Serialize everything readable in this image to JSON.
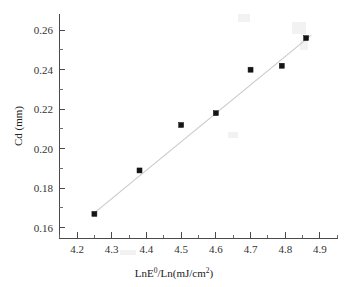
{
  "chart_data": {
    "type": "scatter",
    "title": "",
    "xlabel": "LnE⁰/Ln(mJ/cm²)",
    "xlabel_base": "LnE",
    "xlabel_sup": "0",
    "xlabel_rest": "/Ln(mJ/cm",
    "xlabel_sup2": "2",
    "xlabel_end": ")",
    "ylabel": "Cd (mm)",
    "xlim": [
      4.148,
      4.952
    ],
    "ylim": [
      0.1548,
      0.2682
    ],
    "grid": false,
    "legend": null,
    "x": [
      4.25,
      4.38,
      4.5,
      4.6,
      4.7,
      4.79,
      4.86
    ],
    "y": [
      0.167,
      0.189,
      0.212,
      0.218,
      0.24,
      0.242,
      0.256
    ],
    "points": [
      {
        "x": 4.25,
        "y": 0.167
      },
      {
        "x": 4.38,
        "y": 0.189
      },
      {
        "x": 4.5,
        "y": 0.212
      },
      {
        "x": 4.6,
        "y": 0.218
      },
      {
        "x": 4.7,
        "y": 0.24
      },
      {
        "x": 4.79,
        "y": 0.242
      },
      {
        "x": 4.86,
        "y": 0.256
      }
    ],
    "marker": {
      "shape": "square",
      "color": "#151515",
      "size": 5
    },
    "fit_line": {
      "type": "linear",
      "color": "#c9c9c9",
      "x_start": 4.25,
      "y_start": 0.1675,
      "x_end": 4.875,
      "y_end": 0.2575
    },
    "x_ticks": [
      {
        "value": 4.2,
        "label": "4.2"
      },
      {
        "value": 4.3,
        "label": "4.3"
      },
      {
        "value": 4.4,
        "label": "4.4"
      },
      {
        "value": 4.5,
        "label": "4.5"
      },
      {
        "value": 4.6,
        "label": "4.6"
      },
      {
        "value": 4.7,
        "label": "4.7"
      },
      {
        "value": 4.8,
        "label": "4.8"
      },
      {
        "value": 4.9,
        "label": "4.9"
      }
    ],
    "x_minor_ticks": [
      4.15,
      4.25,
      4.35,
      4.45,
      4.55,
      4.65,
      4.75,
      4.85,
      4.95
    ],
    "y_ticks": [
      {
        "value": 0.16,
        "label": "0.16"
      },
      {
        "value": 0.18,
        "label": "0.18"
      },
      {
        "value": 0.2,
        "label": "0.20"
      },
      {
        "value": 0.22,
        "label": "0.22"
      },
      {
        "value": 0.24,
        "label": "0.24"
      },
      {
        "value": 0.26,
        "label": "0.26"
      }
    ],
    "y_minor_ticks": [
      0.17,
      0.19,
      0.21,
      0.23,
      0.25
    ],
    "axis_color": "#4a4a4a",
    "background_color": "#ffffff"
  },
  "plot_geometry": {
    "left": 59,
    "right": 338,
    "top": 14,
    "bottom": 238
  }
}
